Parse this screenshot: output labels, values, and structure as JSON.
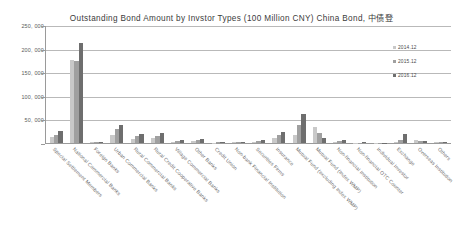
{
  "chart_data": {
    "type": "bar",
    "title": "Outstanding Bond Amount by Invstor Types (100 Million CNY) China Bond, 中债登",
    "xlabel": "",
    "ylabel": "",
    "ylim": [
      0,
      250000
    ],
    "ytick_labels": [
      "250, 000",
      "200, 000",
      "150, 000",
      "100, 000",
      "50, 000",
      "-"
    ],
    "ytick_values": [
      250000,
      200000,
      150000,
      100000,
      50000,
      0
    ],
    "grid": true,
    "legend_position": "right",
    "categories": [
      "Special Settlement Members",
      "National Commercial Banks",
      "Foreign Banks",
      "Urban Commercial Banks",
      "Rural Commercial Banks",
      "Rural Credit Cooperative Banks",
      "Village Commercial Banks",
      "Other Banks",
      "Credit Union",
      "Non-bank Financial Institution",
      "Securities Firms",
      "Insurance",
      "Mutual Fund (excluding Index WMP)",
      "Mutual Fund (Index WMP)",
      "Non-financial Institution",
      "Non-financial OTC Counter",
      "Individual Investor",
      "Exchange",
      "Overseas Institution",
      "Others"
    ],
    "series": [
      {
        "name": "2014.12",
        "color": "#c9c9c9",
        "values": [
          13000,
          176000,
          1200,
          18000,
          9000,
          11000,
          1500,
          5200,
          700,
          1900,
          2800,
          10500,
          17500,
          33000,
          2400,
          600,
          400,
          3200,
          6000,
          2100
        ]
      },
      {
        "name": "2015.12",
        "color": "#a0a0a0",
        "values": [
          17500,
          174000,
          2000,
          30000,
          14000,
          15500,
          3800,
          7000,
          1100,
          2400,
          4800,
          17500,
          37500,
          22000,
          4000,
          900,
          700,
          6500,
          4200,
          2600
        ]
      },
      {
        "name": "2016.12",
        "color": "#6e6e6e",
        "values": [
          25000,
          211000,
          2600,
          38000,
          20000,
          21000,
          7000,
          8000,
          1400,
          2800,
          7000,
          22500,
          62000,
          10500,
          5500,
          1200,
          900,
          18500,
          5000,
          2900
        ]
      }
    ]
  },
  "legend": {
    "items": [
      {
        "label": "2014.12"
      },
      {
        "label": "2015.12"
      },
      {
        "label": "2016.12"
      }
    ]
  }
}
